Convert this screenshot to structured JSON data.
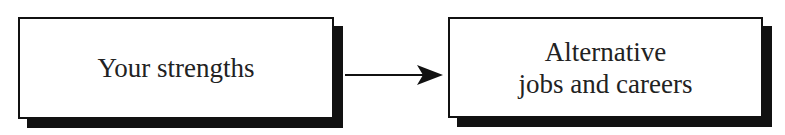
{
  "diagram": {
    "nodes": [
      {
        "id": "strengths",
        "label": "Your strengths"
      },
      {
        "id": "alternatives",
        "label_line1": "Alternative",
        "label_line2": "jobs and careers"
      }
    ],
    "edges": [
      {
        "from": "strengths",
        "to": "alternatives",
        "type": "arrow"
      }
    ]
  }
}
